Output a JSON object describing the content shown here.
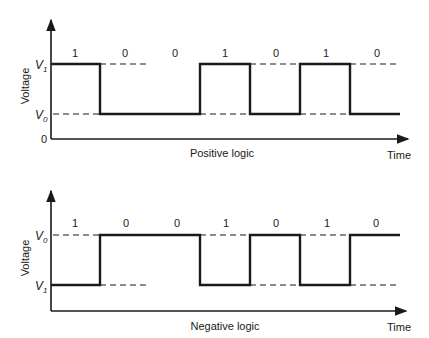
{
  "diagrams": [
    {
      "title": "Positive logic",
      "y_axis_label": "Voltage",
      "x_axis_label": "Time",
      "high_level_label": "V",
      "high_level_sub": "1",
      "low_level_label": "V",
      "low_level_sub": "0",
      "zero_label": "0",
      "bits": [
        "1",
        "0",
        "0",
        "1",
        "0",
        "1",
        "0"
      ]
    },
    {
      "title": "Negative logic",
      "y_axis_label": "Voltage",
      "x_axis_label": "Time",
      "high_level_label": "V",
      "high_level_sub": "0",
      "low_level_label": "V",
      "low_level_sub": "1",
      "bits": [
        "1",
        "0",
        "0",
        "1",
        "0",
        "1",
        "0"
      ]
    }
  ],
  "colors": {
    "line": "#1a1a1a",
    "background": "#ffffff"
  }
}
